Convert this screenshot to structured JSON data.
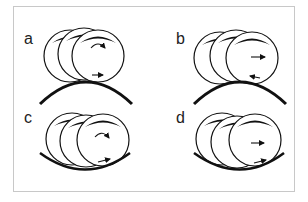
{
  "figure": {
    "frame_color": "#c8c8c8",
    "stroke_color": "#111111",
    "panels": [
      {
        "label": "a",
        "surface": "convex",
        "top_arrow": "curved-clockwise",
        "bottom_arrow": "right"
      },
      {
        "label": "b",
        "surface": "convex",
        "top_arrow": "right",
        "bottom_arrow": "left"
      },
      {
        "label": "c",
        "surface": "concave",
        "top_arrow": "curved-clockwise",
        "bottom_arrow": "right"
      },
      {
        "label": "d",
        "surface": "concave",
        "top_arrow": "right",
        "bottom_arrow": "right"
      }
    ]
  }
}
